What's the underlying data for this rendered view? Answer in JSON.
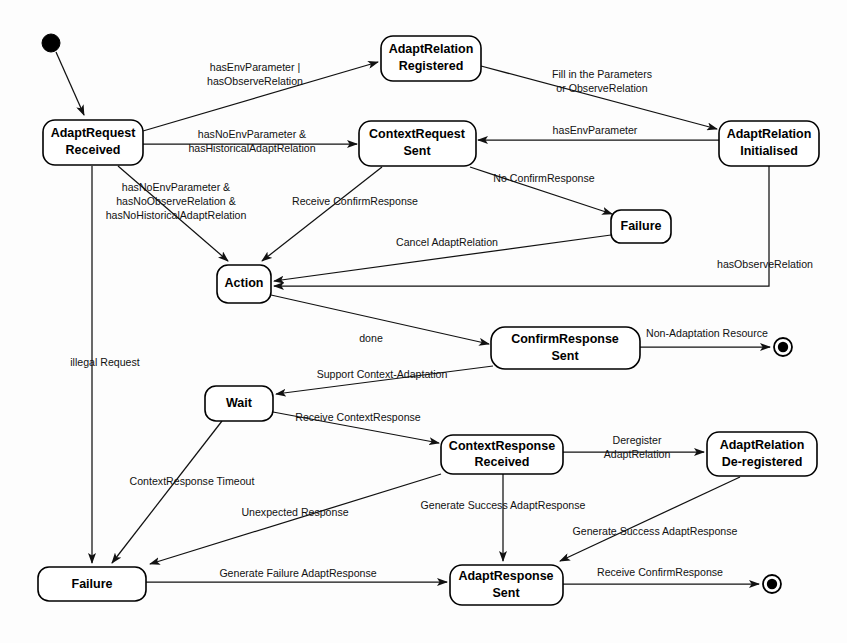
{
  "diagram": {
    "width": 847,
    "height": 643,
    "background": "#fdfdfd",
    "line_color": "#111111",
    "text_color": "#000000"
  },
  "nodes": {
    "initial": {
      "kind": "initial-state",
      "cx": 51,
      "cy": 43,
      "r": 9
    },
    "final_top": {
      "kind": "final-state",
      "cx": 783,
      "cy": 347,
      "r": 9
    },
    "final_bottom": {
      "kind": "final-state",
      "cx": 772,
      "cy": 584,
      "r": 9
    },
    "adapt_request_received": {
      "line1": "AdaptRequest",
      "line2": "Received",
      "x": 43,
      "y": 120,
      "w": 100,
      "h": 45
    },
    "adapt_relation_registered": {
      "line1": "AdaptRelation",
      "line2": "Registered",
      "x": 381,
      "y": 36,
      "w": 100,
      "h": 45
    },
    "adapt_relation_initialised": {
      "line1": "AdaptRelation",
      "line2": "Initialised",
      "x": 719,
      "y": 121,
      "w": 100,
      "h": 45
    },
    "context_request_sent": {
      "line1": "ContextRequest",
      "line2": "Sent",
      "x": 359,
      "y": 121,
      "w": 117,
      "h": 45
    },
    "action": {
      "line1": "Action",
      "line2": "",
      "x": 217,
      "y": 265,
      "w": 54,
      "h": 38
    },
    "failure_mid": {
      "line1": "Failure",
      "line2": "",
      "x": 611,
      "y": 210,
      "w": 60,
      "h": 33
    },
    "confirm_response_sent": {
      "line1": "ConfirmResponse",
      "line2": "Sent",
      "x": 491,
      "y": 327,
      "w": 149,
      "h": 42
    },
    "wait": {
      "line1": "Wait",
      "line2": "",
      "x": 205,
      "y": 386,
      "w": 68,
      "h": 35
    },
    "context_response_received": {
      "line1": "ContextResponse",
      "line2": "Received",
      "x": 441,
      "y": 435,
      "w": 122,
      "h": 39
    },
    "adapt_relation_deregistered": {
      "line1": "AdaptRelation",
      "line2": "De-registered",
      "x": 707,
      "y": 432,
      "w": 110,
      "h": 44
    },
    "failure_bottom": {
      "line1": "Failure",
      "line2": "",
      "x": 38,
      "y": 567,
      "w": 108,
      "h": 34
    },
    "adapt_response_sent": {
      "line1": "AdaptResponse",
      "line2": "Sent",
      "x": 450,
      "y": 565,
      "w": 113,
      "h": 40
    }
  },
  "edges": [
    {
      "id": "e-initial-to-adaptrequest",
      "from": "initial",
      "to": "adapt_request_received",
      "label": "",
      "label2": ""
    },
    {
      "id": "e-adaptrequest-to-registered",
      "from": "adapt_request_received",
      "to": "adapt_relation_registered",
      "label": "hasEnvParameter |",
      "label2": "hasObserveRelation",
      "lx": 255,
      "ly": 72
    },
    {
      "id": "e-registered-to-initialised",
      "from": "adapt_relation_registered",
      "to": "adapt_relation_initialised",
      "label": "Fill in the Parameters",
      "label2": "or ObserveRelation",
      "lx": 602,
      "ly": 81
    },
    {
      "id": "e-adaptrequest-to-contextrequest",
      "from": "adapt_request_received",
      "to": "context_request_sent",
      "label": "hasNoEnvParameter &",
      "label2": "hasHistoricalAdaptRelation",
      "lx": 250,
      "ly": 139
    },
    {
      "id": "e-initialised-to-contextrequest",
      "from": "adapt_relation_initialised",
      "to": "context_request_sent",
      "label": "hasEnvParameter",
      "label2": "",
      "lx": 590,
      "ly": 132
    },
    {
      "id": "e-adaptrequest-to-action",
      "from": "adapt_request_received",
      "to": "action",
      "label": "hasNoEnvParameter &",
      "label2": "hasNoObserveRelation &",
      "label3": "hasNoHistoricalAdaptRelation",
      "lx": 175,
      "ly": 196
    },
    {
      "id": "e-contextrequest-to-action",
      "from": "context_request_sent",
      "to": "action",
      "label": "Receive ConfirmResponse",
      "label2": "",
      "lx": 355,
      "ly": 201
    },
    {
      "id": "e-contextrequest-to-failure",
      "from": "context_request_sent",
      "to": "failure_mid",
      "label": "No ConfirmResponse",
      "label2": "",
      "lx": 540,
      "ly": 178
    },
    {
      "id": "e-failure-to-action",
      "from": "failure_mid",
      "to": "action",
      "label": "Cancel AdaptRelation",
      "label2": "",
      "lx": 443,
      "ly": 243
    },
    {
      "id": "e-initialised-to-action",
      "from": "adapt_relation_initialised",
      "to": "action",
      "label": "hasObserveRelation",
      "label2": "",
      "lx": 766,
      "ly": 264
    },
    {
      "id": "e-action-to-confirmresponse",
      "from": "action",
      "to": "confirm_response_sent",
      "label": "done",
      "label2": "",
      "lx": 370,
      "ly": 337
    },
    {
      "id": "e-confirmresponse-to-final",
      "from": "confirm_response_sent",
      "to": "final_top",
      "label": "Non-Adaptation Resource",
      "label2": "",
      "lx": 705,
      "ly": 334
    },
    {
      "id": "e-confirmresponse-to-wait",
      "from": "confirm_response_sent",
      "to": "wait",
      "label": "Support Context-Adaptation",
      "label2": "",
      "lx": 380,
      "ly": 375
    },
    {
      "id": "e-wait-to-contextresponse",
      "from": "wait",
      "to": "context_response_received",
      "label": "Receive ContextResponse",
      "label2": "",
      "lx": 355,
      "ly": 417
    },
    {
      "id": "e-wait-to-failure",
      "from": "wait",
      "to": "failure_bottom",
      "label": "ContextResponse Timeout",
      "label2": "",
      "lx": 189,
      "ly": 482
    },
    {
      "id": "e-contextresponse-to-deregistered",
      "from": "context_response_received",
      "to": "adapt_relation_deregistered",
      "label": "Deregister",
      "label2": "AdaptRelation",
      "lx": 636,
      "ly": 448
    },
    {
      "id": "e-contextresponse-to-failure",
      "from": "context_response_received",
      "to": "failure_bottom",
      "label": "Unexpected Response",
      "label2": "",
      "lx": 294,
      "ly": 513
    },
    {
      "id": "e-contextresponse-to-adaptresponse",
      "from": "context_response_received",
      "to": "adapt_response_sent",
      "label": "Generate Success AdaptResponse",
      "label2": "",
      "lx": 500,
      "ly": 505
    },
    {
      "id": "e-deregistered-to-adaptresponse",
      "from": "adapt_relation_deregistered",
      "to": "adapt_response_sent",
      "label": "Generate Success AdaptResponse",
      "label2": "",
      "lx": 654,
      "ly": 532
    },
    {
      "id": "e-failure-to-adaptresponse",
      "from": "failure_bottom",
      "to": "adapt_response_sent",
      "label": "Generate Failure AdaptResponse",
      "label2": "",
      "lx": 297,
      "ly": 574
    },
    {
      "id": "e-adaptresponse-to-final",
      "from": "adapt_response_sent",
      "to": "final_bottom",
      "label": "Receive ConfirmResponse",
      "label2": "",
      "lx": 658,
      "ly": 572
    },
    {
      "id": "e-adaptrequest-to-failure-bottom",
      "from": "adapt_request_received",
      "to": "failure_bottom",
      "label": "illegal Request",
      "label2": "",
      "lx": 104,
      "ly": 363
    }
  ]
}
